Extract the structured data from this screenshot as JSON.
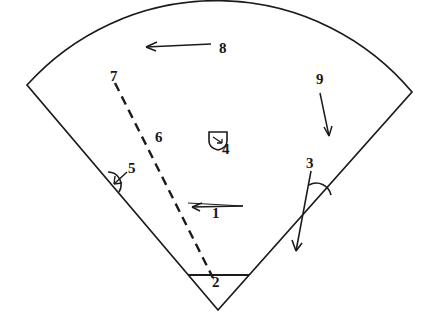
{
  "figure": {
    "background_color": "#ffffff",
    "stroke_color": "#1b1b1d",
    "canvas": {
      "width": 436,
      "height": 326
    },
    "shape": {
      "type": "circular-sector",
      "apex": {
        "x": 218,
        "y": 310
      },
      "left_corner": {
        "x": 27,
        "y": 85
      },
      "right_corner": {
        "x": 412,
        "y": 92
      },
      "arc_top": {
        "x": 225,
        "y": 16
      },
      "arc_sweep_description": "outer arc bulging upward between the two corners"
    },
    "callouts": [
      {
        "id": "1",
        "label": "1",
        "label_x": 212,
        "label_y": 213,
        "kind": "leader-arrow",
        "arrow_direction": "left",
        "points_to": "dashed radial line",
        "from": {
          "x": 243,
          "y": 211
        },
        "to": {
          "x": 192,
          "y": 207
        }
      },
      {
        "id": "2",
        "label": "2",
        "label_x": 212,
        "label_y": 281,
        "kind": "chord-line",
        "points_to": "horizontal chord near apex",
        "from": {
          "x": 188,
          "y": 275
        },
        "to": {
          "x": 249,
          "y": 275
        }
      },
      {
        "id": "3",
        "label": "3",
        "label_x": 306,
        "label_y": 163,
        "kind": "angle-arc-with-arrow",
        "points_to": "angle between arrow and right sector edge",
        "arrow_from": {
          "x": 311,
          "y": 171
        },
        "arrow_to": {
          "x": 295,
          "y": 254
        },
        "arc_center": {
          "x": 318,
          "y": 196
        }
      },
      {
        "id": "4",
        "label": "4",
        "label_x": 222,
        "label_y": 148,
        "kind": "shield-marker",
        "points_to": "small shield-shaped detail symbol",
        "marker": {
          "x": 210,
          "y": 133,
          "width": 18,
          "height": 16
        }
      },
      {
        "id": "5",
        "label": "5",
        "label_x": 128,
        "label_y": 168,
        "kind": "angle-arc-with-arrow",
        "points_to": "angle arc on left sector edge",
        "arc_center": {
          "x": 115,
          "y": 180
        }
      },
      {
        "id": "6",
        "label": "6",
        "label_x": 155,
        "label_y": 136,
        "kind": "plain-label",
        "points_to": "dashed radial line (mid region)"
      },
      {
        "id": "7",
        "label": "7",
        "label_x": 110,
        "label_y": 75,
        "kind": "plain-label",
        "points_to": "upper end of dashed radial line"
      },
      {
        "id": "8",
        "label": "8",
        "label_x": 219,
        "label_y": 47,
        "kind": "leader-arrow",
        "arrow_direction": "left",
        "points_to": "upper arc interior region",
        "from": {
          "x": 211,
          "y": 44
        },
        "to": {
          "x": 144,
          "y": 45
        }
      },
      {
        "id": "9",
        "label": "9",
        "label_x": 316,
        "label_y": 79,
        "kind": "leader-arrow",
        "arrow_direction": "down",
        "points_to": "right interior region",
        "from": {
          "x": 320,
          "y": 93
        },
        "to": {
          "x": 328,
          "y": 138
        }
      }
    ],
    "dashed_line": {
      "name": "dashed-radial-line",
      "from": {
        "x": 115,
        "y": 83
      },
      "to": {
        "x": 213,
        "y": 278
      },
      "dash_pattern": "9 6"
    }
  }
}
